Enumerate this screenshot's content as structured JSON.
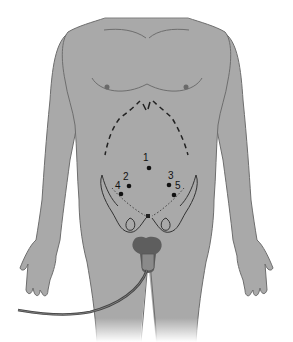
{
  "figure": {
    "colors": {
      "skin": "#a9a9a9",
      "outline": "#6e6e6e",
      "marks": "#222222",
      "background": "#ffffff"
    },
    "ports": [
      {
        "label": "1",
        "x": 149,
        "y": 168
      },
      {
        "label": "2",
        "x": 129,
        "y": 186
      },
      {
        "label": "3",
        "x": 169,
        "y": 185
      },
      {
        "label": "4",
        "x": 121,
        "y": 194
      },
      {
        "label": "5",
        "x": 174,
        "y": 195
      }
    ]
  }
}
